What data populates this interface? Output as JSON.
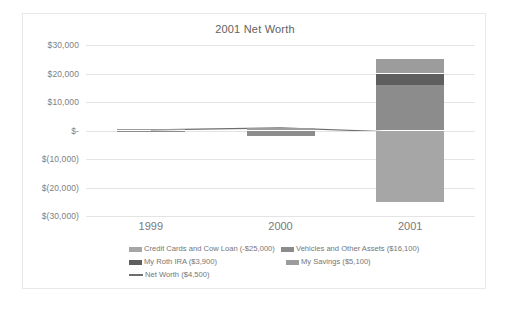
{
  "chart_data": {
    "type": "bar",
    "subtype": "stacked-bar-with-line",
    "title": "2001 Net Worth",
    "xlabel": "",
    "ylabel": "",
    "categories": [
      "1999",
      "2000",
      "2001"
    ],
    "ylim": [
      -30000,
      30000
    ],
    "yticks": [
      30000,
      20000,
      10000,
      0,
      -10000,
      -20000,
      -30000
    ],
    "ytick_labels": [
      "$30,000",
      "$20,000",
      "$10,000",
      "$-",
      "$(10,000)",
      "$(20,000)",
      "$(30,000)"
    ],
    "grid": true,
    "legend_position": "bottom",
    "series": [
      {
        "name": "Credit Cards and Cow Loan (-$25,000)",
        "label": "Credit Cards and Cow Loan (-$25,000)",
        "color": "#a6a6a6",
        "type": "bar",
        "values": [
          0,
          0,
          -25000
        ]
      },
      {
        "name": "Vehicles and Other Assets ($16,100)",
        "label": "Vehicles and Other Assets ($16,100)",
        "color": "#8c8c8c",
        "type": "bar",
        "values": [
          -500,
          -1800,
          16100
        ]
      },
      {
        "name": "My Roth IRA ($3,900)",
        "label": "My Roth IRA ($3,900)",
        "color": "#5e5e5e",
        "type": "bar",
        "values": [
          0,
          0,
          3900
        ]
      },
      {
        "name": "My Savings ($5,100)",
        "label": "My Savings ($5,100)",
        "color": "#9c9c9c",
        "type": "bar",
        "values": [
          600,
          900,
          5100
        ]
      },
      {
        "name": "Net Worth ($4,500)",
        "label": "Net Worth ($4,500)",
        "color": "#6d6d6d",
        "type": "line",
        "values": [
          200,
          900,
          -700
        ]
      }
    ]
  },
  "legend": {
    "rows": [
      [
        {
          "label": "Credit Cards and Cow Loan (-$25,000)",
          "color": "#a6a6a6",
          "kind": "swatch"
        },
        {
          "label": "Vehicles and Other Assets ($16,100)",
          "color": "#8c8c8c",
          "kind": "swatch"
        }
      ],
      [
        {
          "label": "My Roth IRA ($3,900)",
          "color": "#5e5e5e",
          "kind": "swatch"
        },
        {
          "label": "My Savings ($5,100)",
          "color": "#9c9c9c",
          "kind": "swatch"
        }
      ],
      [
        {
          "label": "Net Worth ($4,500)",
          "color": "#6d6d6d",
          "kind": "line"
        }
      ]
    ]
  },
  "colors": {
    "background": "#ffffff",
    "frame_border": "#e8e8e8",
    "gridline": "#e4e4e4",
    "axis_text": "#808080",
    "title_text": "#626262"
  }
}
